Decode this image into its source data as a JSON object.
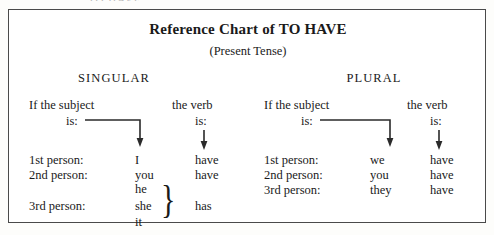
{
  "page": {
    "cut_off_text_above": "TO HAVE"
  },
  "chart": {
    "title": "Reference Chart of TO HAVE",
    "subtitle": "(Present Tense)",
    "columns": [
      {
        "heading": "SINGULAR",
        "subject_header_line1": "If the subject",
        "subject_header_line2": "is:",
        "verb_header_line1": "the verb",
        "verb_header_line2": "is:",
        "rows": [
          {
            "person": "1st  person:",
            "pronouns": [
              "I"
            ],
            "verb": "have"
          },
          {
            "person": "2nd person:",
            "pronouns": [
              "you"
            ],
            "verb": "have"
          },
          {
            "person": "3rd  person:",
            "pronouns": [
              "he",
              "she",
              "it"
            ],
            "verb": "has",
            "braced": true
          }
        ]
      },
      {
        "heading": "PLURAL",
        "subject_header_line1": "If the subject",
        "subject_header_line2": "is:",
        "verb_header_line1": "the verb",
        "verb_header_line2": "is:",
        "rows": [
          {
            "person": "1st  person:",
            "pronouns": [
              "we"
            ],
            "verb": "have"
          },
          {
            "person": "2nd person:",
            "pronouns": [
              "you"
            ],
            "verb": "have"
          },
          {
            "person": "3rd  person:",
            "pronouns": [
              "they"
            ],
            "verb": "have"
          }
        ]
      }
    ],
    "brace_glyph": "}",
    "colors": {
      "border": "#4a4a4a",
      "text": "#1a1a1a",
      "paper": "#ffffff"
    }
  }
}
